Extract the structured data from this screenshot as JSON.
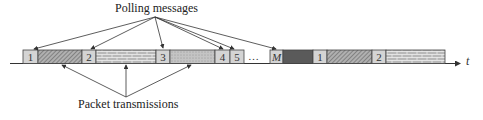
{
  "labels": {
    "polling": "Polling messages",
    "packet": "Packet transmissions",
    "axis": "t",
    "ellipsis": "…"
  },
  "slots": [
    {
      "type": "poll",
      "label": "1",
      "x": 23,
      "w": 15
    },
    {
      "type": "packet",
      "pattern": "hatch",
      "x": 38,
      "w": 44
    },
    {
      "type": "poll",
      "label": "2",
      "x": 82,
      "w": 14
    },
    {
      "type": "packet",
      "pattern": "brick",
      "x": 96,
      "w": 60
    },
    {
      "type": "poll",
      "label": "3",
      "x": 156,
      "w": 14
    },
    {
      "type": "packet",
      "pattern": "dots",
      "x": 170,
      "w": 45
    },
    {
      "type": "poll",
      "label": "4",
      "x": 215,
      "w": 15
    },
    {
      "type": "poll",
      "label": "5",
      "x": 230,
      "w": 14
    },
    {
      "type": "poll",
      "label": "M",
      "x": 270,
      "w": 13
    },
    {
      "type": "packet",
      "pattern": "dark",
      "x": 283,
      "w": 30
    },
    {
      "type": "poll",
      "label": "1",
      "x": 313,
      "w": 14
    },
    {
      "type": "packet",
      "pattern": "hatch",
      "x": 327,
      "w": 45
    },
    {
      "type": "poll",
      "label": "2",
      "x": 372,
      "w": 14
    },
    {
      "type": "packet",
      "pattern": "brick",
      "x": 386,
      "w": 59
    }
  ],
  "colors": {
    "poll_fill": "#d4d4d4",
    "hatch_fill": "#a8a8a8",
    "brick_fill": "#b4b4b4",
    "dots_fill": "#c0c0c0",
    "dark_fill": "#5a5a5a",
    "line": "#333333"
  }
}
